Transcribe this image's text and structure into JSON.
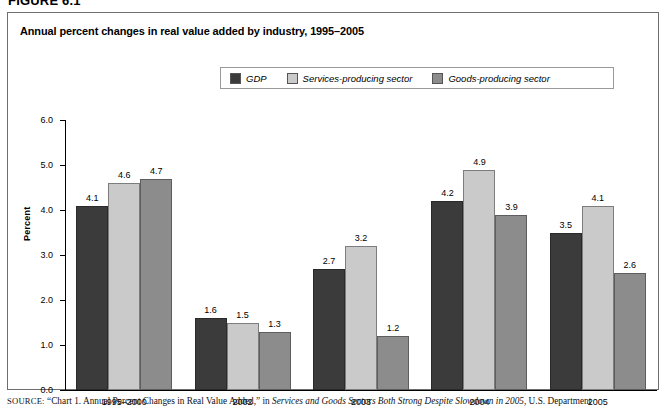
{
  "figure": {
    "number_label": "FIGURE 6.1"
  },
  "chart_title": "Annual percent changes in real value added by industry, 1995–2005",
  "legend": {
    "items": [
      {
        "label": "GDP",
        "color": "#3b3b3b",
        "swatch_name": "legend-swatch-gdp"
      },
      {
        "label": "Services-producing sector",
        "color": "#cacaca",
        "swatch_name": "legend-swatch-services"
      },
      {
        "label": "Goods-producing sector",
        "color": "#8c8c8c",
        "swatch_name": "legend-swatch-goods"
      }
    ]
  },
  "source": {
    "label": "SOURCE:",
    "text": "“Chart 1. Annual Percent Changes in Real Value Added,” in ",
    "italic_title": "Services and Goods Sectors Both Strong Despite Slowdown in 2005",
    "tail": ", U.S. Department"
  },
  "chart_data": {
    "type": "bar",
    "title": "Annual percent changes in real value added by industry, 1995–2005",
    "xlabel": "",
    "ylabel": "Percent",
    "ylim": [
      0.0,
      6.0
    ],
    "ytick_labels": [
      "6.0",
      "5.0",
      "4.0",
      "3.0",
      "2.0",
      "1.0",
      "0.0"
    ],
    "ytick_values": [
      6.0,
      5.0,
      4.0,
      3.0,
      2.0,
      1.0,
      0.0
    ],
    "grid": false,
    "legend_position": "top-center",
    "categories": [
      "1995–2000",
      "2002",
      "2003",
      "2004",
      "2005"
    ],
    "series": [
      {
        "name": "GDP",
        "color": "#3b3b3b",
        "values": [
          4.1,
          1.6,
          2.7,
          4.2,
          3.5
        ]
      },
      {
        "name": "Services-producing sector",
        "color": "#cacaca",
        "values": [
          4.6,
          1.5,
          3.2,
          4.9,
          4.1
        ]
      },
      {
        "name": "Goods-producing sector",
        "color": "#8c8c8c",
        "values": [
          4.7,
          1.3,
          1.2,
          3.9,
          2.6
        ]
      }
    ]
  }
}
